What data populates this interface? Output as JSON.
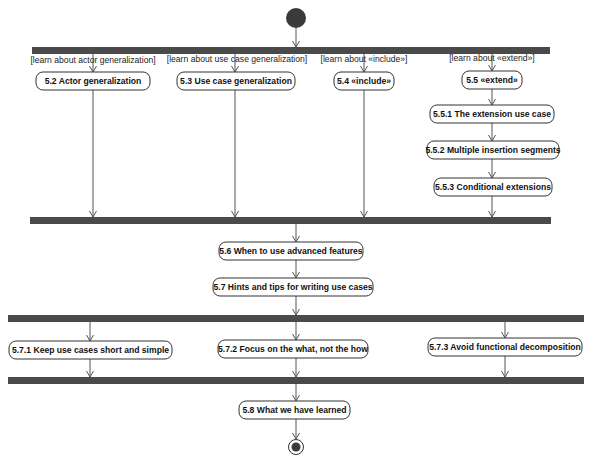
{
  "diagram": {
    "type": "uml-activity-diagram",
    "initial_node": {
      "x": 296,
      "y": 18,
      "r": 10
    },
    "final_node": {
      "x": 296,
      "y": 447,
      "r_outer": 7.5,
      "r_inner": 4.5
    },
    "colors": {
      "bar": "#4a4a4a",
      "edge": "#555555",
      "node_border": "#333333",
      "text": "#111111",
      "initial": "#3a3a3a"
    },
    "bars": [
      {
        "id": "fork1",
        "x": 32,
        "y": 47,
        "w": 518,
        "h": 7
      },
      {
        "id": "join1",
        "x": 30,
        "y": 217,
        "w": 521,
        "h": 7
      },
      {
        "id": "fork2",
        "x": 8,
        "y": 315,
        "w": 576,
        "h": 7
      },
      {
        "id": "join2",
        "x": 8,
        "y": 377,
        "w": 576,
        "h": 7
      }
    ],
    "guards": [
      {
        "id": "g1",
        "text": "[learn about actor generalization]",
        "x": 93,
        "y": 63
      },
      {
        "id": "g2",
        "text": "[learn about use case generalization]",
        "x": 237,
        "y": 62
      },
      {
        "id": "g3",
        "text": "[learn about «include»]",
        "x": 364,
        "y": 62
      },
      {
        "id": "g4",
        "text": "[learn about «extend»]",
        "x": 492,
        "y": 61
      }
    ],
    "nodes": [
      {
        "id": "n52",
        "label": "5.2 Actor generalization",
        "x": 36,
        "y": 72,
        "w": 114,
        "h": 18
      },
      {
        "id": "n53",
        "label": "5.3 Use case generalization",
        "x": 177,
        "y": 72,
        "w": 118,
        "h": 18
      },
      {
        "id": "n54",
        "label": "5.4 «include»",
        "x": 334,
        "y": 72,
        "w": 60,
        "h": 18
      },
      {
        "id": "n55",
        "label": "5.5 «extend»",
        "x": 462,
        "y": 71,
        "w": 60,
        "h": 18
      },
      {
        "id": "n551",
        "label": "5.5.1 The extension use case",
        "x": 430,
        "y": 105,
        "w": 124,
        "h": 18
      },
      {
        "id": "n552",
        "label": "5.5.2 Multiple insertion segments",
        "x": 427,
        "y": 141,
        "w": 132,
        "h": 18
      },
      {
        "id": "n553",
        "label": "5.5.3 Conditional extensions",
        "x": 434,
        "y": 178,
        "w": 118,
        "h": 18
      },
      {
        "id": "n56",
        "label": "5.6 When to use advanced features",
        "x": 219,
        "y": 242,
        "w": 144,
        "h": 18
      },
      {
        "id": "n57",
        "label": "5.7 Hints and tips for writing use cases",
        "x": 213,
        "y": 278,
        "w": 160,
        "h": 18
      },
      {
        "id": "n571",
        "label": "5.7.1 Keep use cases short and simple",
        "x": 9,
        "y": 341,
        "w": 163,
        "h": 18
      },
      {
        "id": "n572",
        "label": "5.7.2 Focus on the what, not the how",
        "x": 218,
        "y": 340,
        "w": 150,
        "h": 18
      },
      {
        "id": "n573",
        "label": "5.7.3 Avoid functional decomposition",
        "x": 428,
        "y": 338,
        "w": 154,
        "h": 18
      },
      {
        "id": "n58",
        "label": "5.8 What we have learned",
        "x": 239,
        "y": 401,
        "w": 111,
        "h": 18
      }
    ],
    "edges": [
      {
        "from": "initial",
        "x1": 296,
        "y1": 28,
        "x2": 296,
        "y2": 47
      },
      {
        "from": "fork1",
        "to": "n52",
        "x1": 93,
        "y1": 54,
        "x2": 93,
        "y2": 72
      },
      {
        "from": "fork1",
        "to": "n53",
        "x1": 235,
        "y1": 54,
        "x2": 235,
        "y2": 72
      },
      {
        "from": "fork1",
        "to": "n54",
        "x1": 364,
        "y1": 54,
        "x2": 364,
        "y2": 72
      },
      {
        "from": "fork1",
        "to": "n55",
        "x1": 492,
        "y1": 54,
        "x2": 492,
        "y2": 71
      },
      {
        "from": "n52",
        "to": "join1",
        "x1": 93,
        "y1": 90,
        "x2": 93,
        "y2": 217
      },
      {
        "from": "n53",
        "to": "join1",
        "x1": 235,
        "y1": 90,
        "x2": 235,
        "y2": 217
      },
      {
        "from": "n54",
        "to": "join1",
        "x1": 364,
        "y1": 90,
        "x2": 364,
        "y2": 217
      },
      {
        "from": "n55",
        "to": "n551",
        "x1": 492,
        "y1": 89,
        "x2": 492,
        "y2": 105
      },
      {
        "from": "n551",
        "to": "n552",
        "x1": 492,
        "y1": 123,
        "x2": 492,
        "y2": 141
      },
      {
        "from": "n552",
        "to": "n553",
        "x1": 492,
        "y1": 159,
        "x2": 492,
        "y2": 178
      },
      {
        "from": "n553",
        "to": "join1",
        "x1": 492,
        "y1": 196,
        "x2": 492,
        "y2": 217
      },
      {
        "from": "join1",
        "to": "n56",
        "x1": 296,
        "y1": 224,
        "x2": 296,
        "y2": 242
      },
      {
        "from": "n56",
        "to": "n57",
        "x1": 296,
        "y1": 260,
        "x2": 296,
        "y2": 278
      },
      {
        "from": "n57",
        "to": "fork2",
        "x1": 296,
        "y1": 296,
        "x2": 296,
        "y2": 315
      },
      {
        "from": "fork2",
        "to": "n571",
        "x1": 90,
        "y1": 322,
        "x2": 90,
        "y2": 341
      },
      {
        "from": "fork2",
        "to": "n572",
        "x1": 296,
        "y1": 322,
        "x2": 296,
        "y2": 340
      },
      {
        "from": "fork2",
        "to": "n573",
        "x1": 505,
        "y1": 322,
        "x2": 505,
        "y2": 338
      },
      {
        "from": "n571",
        "to": "join2",
        "x1": 90,
        "y1": 359,
        "x2": 90,
        "y2": 377
      },
      {
        "from": "n572",
        "to": "join2",
        "x1": 296,
        "y1": 358,
        "x2": 296,
        "y2": 377
      },
      {
        "from": "n573",
        "to": "join2",
        "x1": 505,
        "y1": 356,
        "x2": 505,
        "y2": 377
      },
      {
        "from": "join2",
        "to": "n58",
        "x1": 296,
        "y1": 384,
        "x2": 296,
        "y2": 401
      },
      {
        "from": "n58",
        "to": "final",
        "x1": 296,
        "y1": 419,
        "x2": 296,
        "y2": 439
      }
    ]
  }
}
